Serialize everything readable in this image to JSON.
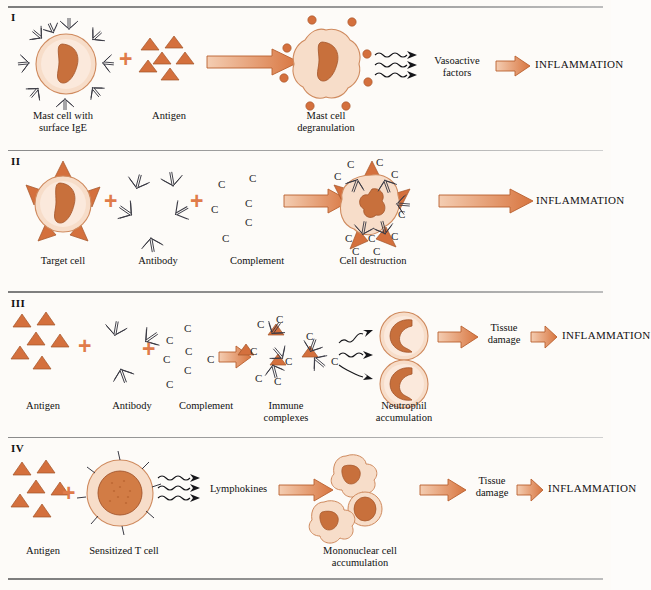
{
  "figure": {
    "kind": "four-panel immunology diagram",
    "accent_color": "#d2691e",
    "cell_fill": "#f6ddcb",
    "nucleus_color": "#c8703c",
    "antigen_color": "#d4703d",
    "rule_color": "#8a8a8a",
    "inflammation_label": "INFLAMMATION"
  },
  "panels": [
    {
      "numeral": "I",
      "labels": {
        "cell": "Mast cell with\nsurface IgE",
        "antigen": "Antigen",
        "product": "Mast cell\ndegranulation",
        "mediator": "Vasoactive\nfactors",
        "outcome": "INFLAMMATION"
      }
    },
    {
      "numeral": "II",
      "labels": {
        "cell": "Target cell",
        "antibody": "Antibody",
        "complement": "Complement",
        "product": "Cell destruction",
        "outcome": "INFLAMMATION"
      },
      "complement_letters": [
        "C",
        "C",
        "C",
        "C",
        "C",
        "C",
        "C"
      ]
    },
    {
      "numeral": "III",
      "labels": {
        "antigen": "Antigen",
        "antibody": "Antibody",
        "complement": "Complement",
        "complexes": "Immune\ncomplexes",
        "cells": "Neutrophil\naccumulation",
        "damage": "Tissue\ndamage",
        "outcome": "INFLAMMATION"
      },
      "complement_letters": [
        "C",
        "C",
        "C",
        "C",
        "C",
        "C",
        "C"
      ]
    },
    {
      "numeral": "IV",
      "labels": {
        "antigen": "Antigen",
        "cell": "Sensitized T cell",
        "mediator": "Lymphokines",
        "product": "Mononuclear cell\naccumulation",
        "damage": "Tissue\ndamage",
        "outcome": "INFLAMMATION"
      }
    }
  ]
}
